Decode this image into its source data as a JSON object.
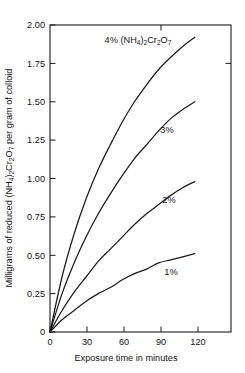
{
  "chart_data": {
    "type": "line",
    "title": "",
    "xlabel": "Exposure time in minutes",
    "ylabel": "Milligrams of reduced (NH4)2Cr2O7 per gram of colloid",
    "ylabel_parts": {
      "prefix": "Milligrams of reduced (NH",
      "sub1": "4",
      "mid1": ")",
      "sub2": "2",
      "mid2": "Cr",
      "sub3": "2",
      "mid3": "O",
      "sub4": "7",
      "suffix": " per gram of colloid"
    },
    "xlim": [
      0,
      150
    ],
    "ylim": [
      0,
      2.0
    ],
    "xticks": [
      0,
      30,
      60,
      90,
      120
    ],
    "xticklabels": [
      "0",
      "30",
      "60",
      "90",
      "120"
    ],
    "yticks": [
      0,
      0.25,
      0.5,
      0.75,
      1.0,
      1.25,
      1.5,
      1.75,
      2.0
    ],
    "yticklabels": [
      "0",
      "0.25",
      "0.50",
      "0.75",
      "1.00",
      "1.25",
      "1.50",
      "1.75",
      "2.00"
    ],
    "grid": false,
    "legend_position": "inline-curve-labels",
    "x": [
      0,
      10,
      20,
      30,
      40,
      50,
      60,
      70,
      80,
      90,
      100,
      110,
      120
    ],
    "series": [
      {
        "name": "4%",
        "label": "4% (NH4)2Cr2O7",
        "values": [
          0,
          0.36,
          0.64,
          0.87,
          1.06,
          1.22,
          1.37,
          1.5,
          1.61,
          1.71,
          1.79,
          1.86,
          1.92
        ]
      },
      {
        "name": "3%",
        "label": "3%",
        "values": [
          0,
          0.25,
          0.45,
          0.62,
          0.77,
          0.9,
          1.02,
          1.13,
          1.22,
          1.31,
          1.39,
          1.45,
          1.5
        ]
      },
      {
        "name": "2%",
        "label": "2%",
        "values": [
          0,
          0.14,
          0.26,
          0.36,
          0.46,
          0.54,
          0.62,
          0.7,
          0.77,
          0.83,
          0.89,
          0.94,
          0.98
        ]
      },
      {
        "name": "1%",
        "label": "1%",
        "values": [
          0,
          0.08,
          0.14,
          0.2,
          0.25,
          0.29,
          0.34,
          0.38,
          0.41,
          0.45,
          0.47,
          0.49,
          0.51
        ]
      }
    ],
    "annotations": [
      {
        "text": "4% (NH4)2Cr2O7",
        "x": 55,
        "y": 1.86
      },
      {
        "text": "3%",
        "x": 84,
        "y": 1.3
      },
      {
        "text": "2%",
        "x": 86,
        "y": 0.86
      },
      {
        "text": "1%",
        "x": 88,
        "y": 0.41
      }
    ],
    "colors": {
      "line": "#1a1a1a",
      "background": "#ffffff",
      "axis": "#1a1a1a"
    }
  },
  "labels": {
    "series_4_pct_prefix": "4% (NH",
    "series_4_pct_sub1": "4",
    "series_4_pct_mid1": ")",
    "series_4_pct_sub2": "2",
    "series_4_pct_mid2": "Cr",
    "series_4_pct_sub3": "2",
    "series_4_pct_mid3": "O",
    "series_4_pct_sub4": "7",
    "series_3_pct": "3%",
    "series_2_pct": "2%",
    "series_1_pct": "1%"
  }
}
